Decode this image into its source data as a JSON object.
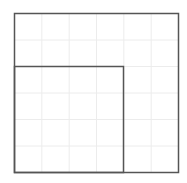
{
  "diagram": {
    "type": "nested-squares-on-grid",
    "grid": {
      "columns": 6,
      "rows": 6,
      "color": "#ececec"
    },
    "outer_square": {
      "units": 6,
      "stroke": "#555555"
    },
    "inner_square": {
      "units": 4,
      "position": "bottom-left",
      "stroke": "#555555"
    },
    "colors": {
      "background": "#ffffff",
      "grid": "#ececec",
      "stroke": "#555555"
    }
  }
}
